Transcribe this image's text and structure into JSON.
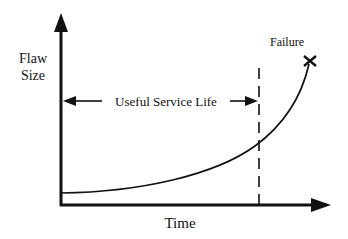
{
  "diagram": {
    "y_axis_label_line1": "Flaw",
    "y_axis_label_line2": "Size",
    "x_axis_label": "Time",
    "failure_label": "Failure",
    "span_label": "Useful Service Life",
    "colors": {
      "ink": "#111111",
      "background": "#ffffff"
    }
  }
}
